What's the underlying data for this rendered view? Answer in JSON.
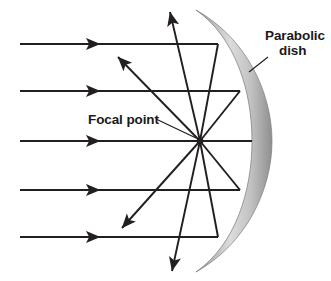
{
  "diagram": {
    "labels": {
      "parabolic_dish_line1": "Parabolic",
      "parabolic_dish_line2": "dish",
      "focal_point": "Focal point"
    },
    "colors": {
      "ray": "#231f20",
      "text": "#1a1a1a",
      "dish_light": "#d9d9d9",
      "dish_mid": "#b3b3b3",
      "dish_dark": "#808080",
      "background": "#ffffff"
    },
    "geometry": {
      "focal_point": {
        "x": 200,
        "y": 141
      },
      "incoming_ray_y": [
        44,
        91,
        141,
        190,
        237
      ],
      "incoming_ray_start_x": 20,
      "incoming_arrow_x": [
        100,
        100,
        100,
        100,
        100
      ],
      "dish_hit_points": [
        {
          "x": 218,
          "y": 44
        },
        {
          "x": 240,
          "y": 91
        },
        {
          "x": 252,
          "y": 141
        },
        {
          "x": 240,
          "y": 190
        },
        {
          "x": 218,
          "y": 237
        }
      ],
      "reflected_arrow_tips": [
        {
          "x": 170,
          "y": 12
        },
        {
          "x": 118,
          "y": 57
        },
        {
          "x": 20,
          "y": 141
        },
        {
          "x": 122,
          "y": 228
        },
        {
          "x": 172,
          "y": 271
        }
      ],
      "dish_top": {
        "x": 196,
        "y": 10
      },
      "dish_bottom": {
        "x": 196,
        "y": 272
      },
      "dish_apex_outer_x": 272,
      "dish_apex_inner_x": 252,
      "leader_dish": {
        "x1": 268,
        "y1": 57,
        "x2": 249,
        "y2": 72
      },
      "leader_focal": {
        "x1": 156,
        "y1": 119,
        "x2": 196,
        "y2": 138
      }
    }
  }
}
